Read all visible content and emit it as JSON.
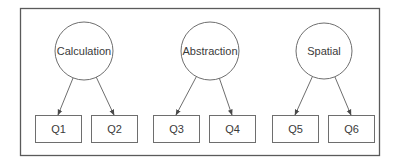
{
  "diagram": {
    "type": "factor-model",
    "colors": {
      "stroke": "#6e6e6e",
      "frame": "#5a5a5a",
      "text": "#3a3a3a",
      "background": "#ffffff"
    },
    "factors": [
      {
        "id": "calculation",
        "label": "Calculation",
        "cx": 84,
        "cy": 51,
        "r": 29
      },
      {
        "id": "abstraction",
        "label": "Abstraction",
        "cx": 210,
        "cy": 51,
        "r": 29
      },
      {
        "id": "spatial",
        "label": "Spatial",
        "cx": 324,
        "cy": 51,
        "r": 28
      }
    ],
    "indicators": [
      {
        "id": "q1",
        "label": "Q1",
        "x": 35,
        "y": 115,
        "w": 46,
        "h": 27
      },
      {
        "id": "q2",
        "label": "Q2",
        "x": 91,
        "y": 115,
        "w": 46,
        "h": 27
      },
      {
        "id": "q3",
        "label": "Q3",
        "x": 153,
        "y": 115,
        "w": 46,
        "h": 27
      },
      {
        "id": "q4",
        "label": "Q4",
        "x": 209,
        "y": 115,
        "w": 46,
        "h": 27
      },
      {
        "id": "q5",
        "label": "Q5",
        "x": 272,
        "y": 115,
        "w": 46,
        "h": 27
      },
      {
        "id": "q6",
        "label": "Q6",
        "x": 328,
        "y": 115,
        "w": 46,
        "h": 27
      }
    ],
    "edges": [
      {
        "from": "calculation",
        "to": "q1"
      },
      {
        "from": "calculation",
        "to": "q2"
      },
      {
        "from": "abstraction",
        "to": "q3"
      },
      {
        "from": "abstraction",
        "to": "q4"
      },
      {
        "from": "spatial",
        "to": "q5"
      },
      {
        "from": "spatial",
        "to": "q6"
      }
    ]
  }
}
